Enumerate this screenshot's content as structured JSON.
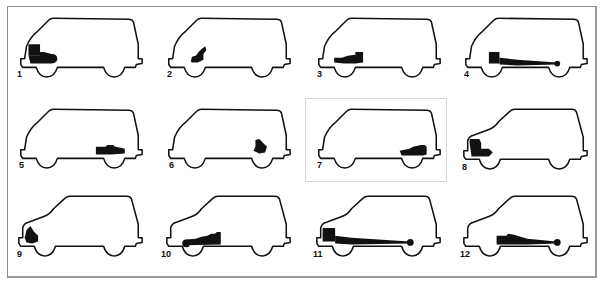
{
  "figure": {
    "type": "drivetrain-layout-diagram",
    "highlighted_index": 7,
    "colors": {
      "outline": "#111111",
      "drivetrain_fill": "#111111",
      "frame_border": "#8e8e8e",
      "highlight_border": "#d6d6d6",
      "background": "#ffffff"
    },
    "body_styles": {
      "bus": "forward-control van profile (short sloped nose)",
      "hood": "hooded van profile (extended front nose)"
    },
    "vans": [
      {
        "label": "1",
        "body": "bus",
        "layout": "front engine, front-wheel drive"
      },
      {
        "label": "2",
        "body": "bus",
        "layout": "compact unit over front axle"
      },
      {
        "label": "3",
        "body": "bus",
        "layout": "mid/under-floor unit behind front axle"
      },
      {
        "label": "4",
        "body": "bus",
        "layout": "front engine, driveshaft to rear axle"
      },
      {
        "label": "5",
        "body": "bus",
        "layout": "rear engine ahead of rear axle"
      },
      {
        "label": "6",
        "body": "bus",
        "layout": "compact unit over rear axle"
      },
      {
        "label": "7",
        "body": "bus",
        "layout": "rear engine over rear axle"
      },
      {
        "label": "8",
        "body": "hood",
        "layout": "front engine over front axle"
      },
      {
        "label": "9",
        "body": "hood",
        "layout": "compact front unit ahead of front axle"
      },
      {
        "label": "10",
        "body": "hood",
        "layout": "under-floor unit driving front axle"
      },
      {
        "label": "11",
        "body": "hood",
        "layout": "front engine, long driveshaft to rear axle"
      },
      {
        "label": "12",
        "body": "hood",
        "layout": "mid under-floor unit, driveshaft to rear axle"
      }
    ]
  }
}
